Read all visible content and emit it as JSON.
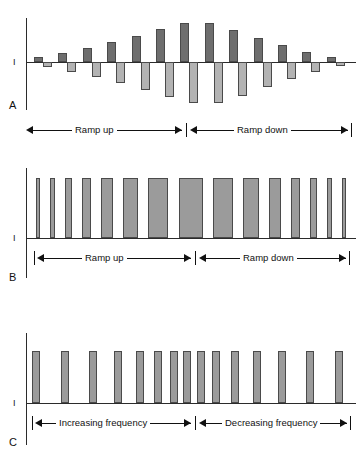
{
  "figure": {
    "background": "#ffffff",
    "colors": {
      "bar_up": "#6e6e6e",
      "bar_down": "#b3b3b3",
      "bar_mid": "#9b9b9b",
      "axis": "#2b2b2b",
      "text": "#111111"
    },
    "axis_label": "I"
  },
  "panels": [
    {
      "letter": "A",
      "axis_label": "I",
      "annotations": [
        {
          "label": "Ramp up"
        },
        {
          "label": "Ramp down"
        }
      ]
    },
    {
      "letter": "B",
      "axis_label": "I",
      "annotations": [
        {
          "label": "Ramp up"
        },
        {
          "label": "Ramp down"
        }
      ]
    },
    {
      "letter": "C",
      "axis_label": "I",
      "annotations": [
        {
          "label": "Increasing frequency"
        },
        {
          "label": "Decreasing frequency"
        }
      ]
    }
  ],
  "chart_data": [
    {
      "type": "bar",
      "panel": "A",
      "title": "Biphasic pulse amplitude ramp up / ramp down",
      "xlabel": "",
      "ylabel": "I",
      "ylim": [
        -1.0,
        1.0
      ],
      "grid": false,
      "legend": "none",
      "description": "Alternating charge-balanced pulse pairs; each pair has a positive (dark) phase and a negative (light) phase whose amplitude rises then falls.",
      "categories": [
        "1",
        "2",
        "3",
        "4",
        "5",
        "6",
        "7",
        "8",
        "9",
        "10",
        "11",
        "12",
        "13"
      ],
      "series": [
        {
          "name": "positive phase",
          "color": "#6e6e6e",
          "values": [
            0.13,
            0.22,
            0.34,
            0.47,
            0.62,
            0.79,
            0.92,
            0.92,
            0.76,
            0.57,
            0.4,
            0.23,
            0.11
          ]
        },
        {
          "name": "negative phase",
          "color": "#b3b3b3",
          "values": [
            -0.11,
            -0.21,
            -0.33,
            -0.46,
            -0.6,
            -0.77,
            -0.9,
            -0.9,
            -0.74,
            -0.55,
            -0.38,
            -0.21,
            -0.09
          ]
        }
      ]
    },
    {
      "type": "bar",
      "panel": "B",
      "title": "Pulse width ramp up / ramp down",
      "xlabel": "",
      "ylabel": "I",
      "ylim": [
        0,
        1.0
      ],
      "grid": false,
      "legend": "none",
      "description": "Constant-amplitude pulses whose width (duration) increases then decreases.",
      "categories": [
        "1",
        "2",
        "3",
        "4",
        "5",
        "6",
        "7",
        "8",
        "9",
        "10",
        "11",
        "12",
        "13",
        "14",
        "15"
      ],
      "values": [
        1,
        1,
        1,
        1,
        1,
        1,
        1,
        1,
        1,
        1,
        1,
        1,
        1,
        1,
        1
      ],
      "widths": [
        4,
        5,
        7,
        9,
        12,
        15,
        20,
        24,
        20,
        16,
        12,
        9,
        7,
        5,
        4
      ]
    },
    {
      "type": "bar",
      "panel": "C",
      "title": "Pulse frequency increasing / decreasing",
      "xlabel": "",
      "ylabel": "I",
      "ylim": [
        0,
        1.0
      ],
      "grid": false,
      "legend": "none",
      "description": "Constant-amplitude, constant-width pulses whose repetition rate increases then decreases.",
      "categories": [
        "1",
        "2",
        "3",
        "4",
        "5",
        "6",
        "7",
        "8",
        "9",
        "10",
        "11",
        "12",
        "13",
        "14",
        "15",
        "16"
      ],
      "values": [
        1,
        1,
        1,
        1,
        1,
        1,
        1,
        1,
        1,
        1,
        1,
        1,
        1,
        1,
        1,
        1
      ],
      "gaps": [
        26,
        24,
        21,
        17,
        13,
        9,
        7,
        7,
        9,
        13,
        17,
        21,
        24,
        26,
        28
      ]
    }
  ]
}
